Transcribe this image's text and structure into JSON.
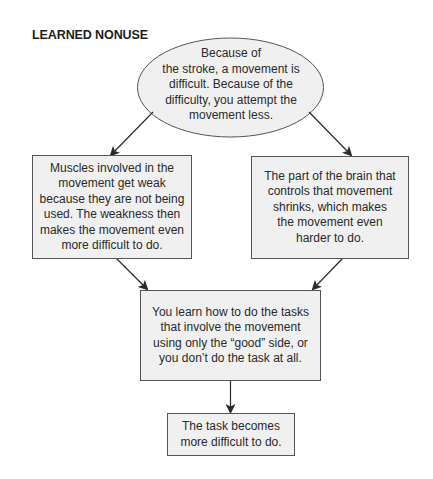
{
  "diagram": {
    "title": "LEARNED NONUSE",
    "nodes": {
      "start": {
        "shape": "ellipse",
        "lines": [
          "Because of",
          "the stroke, a movement is",
          "difficult. Because of the",
          "difficulty, you attempt the",
          "movement less."
        ]
      },
      "muscles": {
        "shape": "box",
        "lines": [
          "Muscles involved in the",
          "movement get weak",
          "because they are not being",
          "used. The weakness then",
          "makes the movement even",
          "more difficult to do."
        ]
      },
      "brain": {
        "shape": "box",
        "lines": [
          "The part of the brain that",
          "controls that movement",
          "shrinks, which makes",
          "the movement even",
          "harder to do."
        ]
      },
      "learn": {
        "shape": "box",
        "lines": [
          "You learn how to do the tasks",
          "that involve the movement",
          "using only the “good” side, or",
          "you don’t do the task at all."
        ]
      },
      "result": {
        "shape": "box",
        "lines": [
          "The task becomes",
          "more difficult to do."
        ]
      }
    },
    "edges": [
      {
        "from": "start",
        "to": "muscles"
      },
      {
        "from": "start",
        "to": "brain"
      },
      {
        "from": "muscles",
        "to": "learn"
      },
      {
        "from": "brain",
        "to": "learn"
      },
      {
        "from": "learn",
        "to": "result"
      }
    ],
    "colors": {
      "node_fill": "#f0f0f0",
      "stroke": "#555555",
      "arrow": "#2a2a2a",
      "text": "#2a2a2a"
    }
  }
}
